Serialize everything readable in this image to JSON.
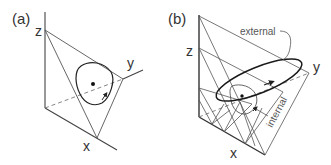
{
  "panels": [
    {
      "label": "(a)",
      "axes": {
        "x": "x",
        "y": "y",
        "z": "z"
      }
    },
    {
      "label": "(b)",
      "axes": {
        "x": "x",
        "y": "y",
        "z": "z"
      },
      "annotations": {
        "external": "external",
        "internal": "internal"
      }
    }
  ],
  "colors": {
    "line": "#444444",
    "thin_line": "#666666",
    "dashed": "#777777",
    "curve": "#222222",
    "background": "#ffffff"
  }
}
